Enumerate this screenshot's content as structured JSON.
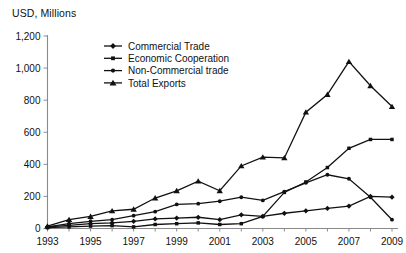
{
  "chart_data": {
    "type": "line",
    "title": "",
    "ylabel": "USD, Millions",
    "xlabel": "",
    "ylim": [
      0,
      1200
    ],
    "yticks": [
      0,
      200,
      400,
      600,
      800,
      1000,
      1200
    ],
    "ytick_labels": [
      "0",
      "200",
      "400",
      "600",
      "800",
      "1,000",
      "1,200"
    ],
    "xlim": [
      1993,
      2009
    ],
    "x": [
      1993,
      1994,
      1995,
      1996,
      1997,
      1998,
      1999,
      2000,
      2001,
      2002,
      2003,
      2004,
      2005,
      2006,
      2007,
      2008,
      2009
    ],
    "xtick_labels": [
      "1993",
      "1995",
      "1997",
      "1999",
      "2001",
      "2003",
      "2005",
      "2007",
      "2009"
    ],
    "xticks_labeled": [
      1993,
      1995,
      1997,
      1999,
      2001,
      2003,
      2005,
      2007,
      2009
    ],
    "grid": false,
    "legend_position": "top-center",
    "series": [
      {
        "name": "Commercial Trade",
        "marker": "diamond",
        "color": "#111111",
        "values": [
          10,
          20,
          30,
          35,
          45,
          60,
          65,
          70,
          55,
          85,
          75,
          95,
          110,
          125,
          140,
          200,
          195
        ]
      },
      {
        "name": "Economic Cooperation",
        "marker": "square",
        "color": "#111111",
        "values": [
          5,
          10,
          15,
          18,
          10,
          25,
          30,
          35,
          25,
          30,
          75,
          225,
          290,
          380,
          500,
          555,
          555
        ]
      },
      {
        "name": "Non-Commercial trade",
        "marker": "circle",
        "color": "#111111",
        "values": [
          10,
          30,
          45,
          55,
          80,
          105,
          150,
          155,
          170,
          195,
          175,
          230,
          285,
          335,
          310,
          195,
          55
        ]
      },
      {
        "name": "Total Exports",
        "marker": "triangle",
        "color": "#111111",
        "values": [
          15,
          55,
          75,
          110,
          120,
          190,
          235,
          295,
          235,
          390,
          445,
          440,
          725,
          835,
          1040,
          890,
          760
        ]
      }
    ]
  },
  "legend": {
    "entries": [
      {
        "label": "Commercial Trade"
      },
      {
        "label": "Economic Cooperation"
      },
      {
        "label": "Non-Commercial trade"
      },
      {
        "label": "Total Exports"
      }
    ]
  }
}
